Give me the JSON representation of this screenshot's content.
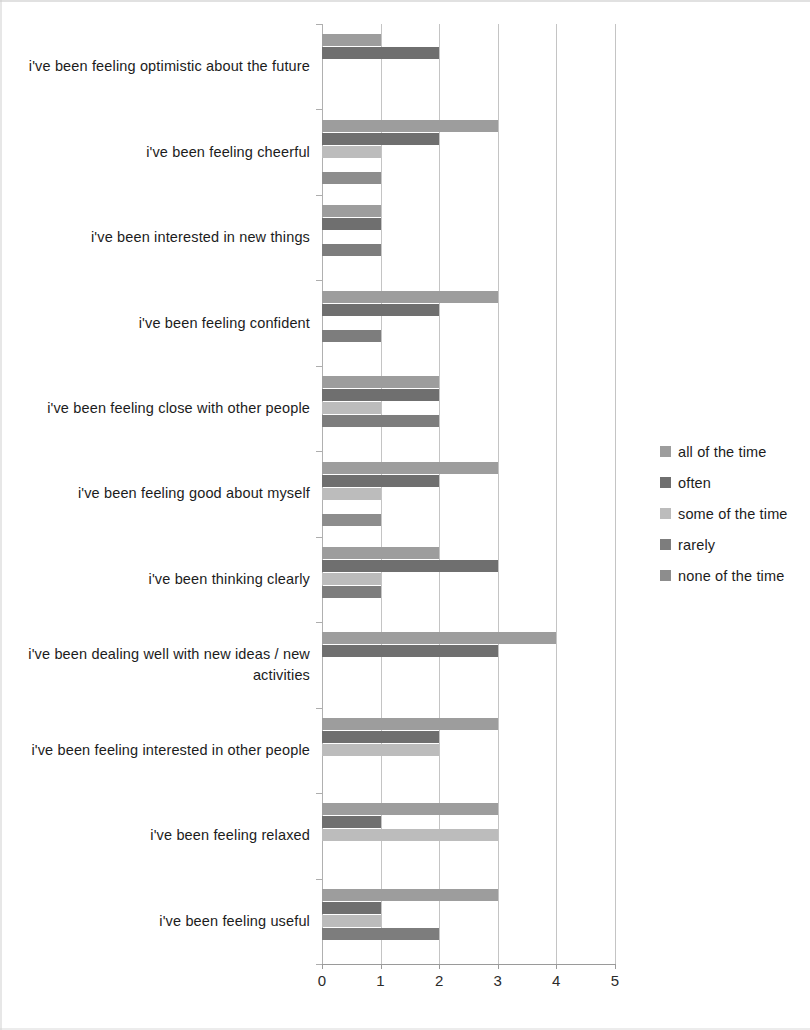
{
  "chart_data": {
    "type": "bar",
    "orientation": "horizontal",
    "grouped": true,
    "title": "",
    "subtitle": "",
    "xlabel": "",
    "ylabel": "",
    "xlim": [
      0,
      5
    ],
    "xticks": [
      "0",
      "1",
      "2",
      "3",
      "4",
      "5"
    ],
    "grid": true,
    "legend_position": "right",
    "categories": [
      "i've been feeling optimistic about the future",
      "i've been feeling cheerful",
      "i've been interested in new things",
      "i've been feeling confident",
      "i've been feeling close with other people",
      "i've been feeling good about myself",
      "i've been thinking clearly",
      "i've been dealing well with new ideas / new activities",
      "i've been feeling interested in other people",
      "i've been feeling relaxed",
      "i've been feeling useful"
    ],
    "series": [
      {
        "name": "all of the time",
        "color": "#9d9d9d",
        "values": [
          1,
          3,
          1,
          3,
          2,
          3,
          2,
          4,
          3,
          3,
          3
        ]
      },
      {
        "name": "often",
        "color": "#6f6f6f",
        "values": [
          2,
          2,
          1,
          2,
          2,
          2,
          3,
          3,
          2,
          1,
          1
        ]
      },
      {
        "name": "some of the time",
        "color": "#bcbcbc",
        "values": [
          0,
          1,
          0,
          0,
          1,
          1,
          1,
          0,
          2,
          3,
          1
        ]
      },
      {
        "name": "rarely",
        "color": "#7d7d7d",
        "values": [
          0,
          0,
          1,
          1,
          2,
          0,
          1,
          0,
          0,
          0,
          2
        ]
      },
      {
        "name": "none of the time",
        "color": "#8d8d8d",
        "values": [
          0,
          1,
          0,
          0,
          0,
          1,
          0,
          0,
          0,
          0,
          0
        ]
      }
    ]
  },
  "legend": {
    "items": [
      {
        "label": "all of the time",
        "color": "#9d9d9d"
      },
      {
        "label": "often",
        "color": "#6f6f6f"
      },
      {
        "label": "some of the time",
        "color": "#bcbcbc"
      },
      {
        "label": "rarely",
        "color": "#7d7d7d"
      },
      {
        "label": "none of the time",
        "color": "#8d8d8d"
      }
    ]
  },
  "axis": {
    "x_tick_labels": [
      "0",
      "1",
      "2",
      "3",
      "4",
      "5"
    ]
  }
}
